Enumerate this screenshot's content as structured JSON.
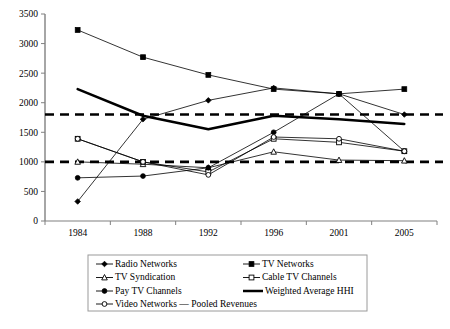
{
  "chart_data": {
    "type": "line",
    "title": "",
    "subtitle": "",
    "xlabel": "",
    "ylabel": "",
    "categories": [
      "1984",
      "1988",
      "1992",
      "1996",
      "2001",
      "2005"
    ],
    "ylim": [
      0,
      3500
    ],
    "ytick_labels": [
      "0",
      "500",
      "1000",
      "1500",
      "2000",
      "2500",
      "3000",
      "3500"
    ],
    "ytick_values": [
      0,
      500,
      1000,
      1500,
      2000,
      2500,
      3000,
      3500
    ],
    "grid": false,
    "legend_position": "bottom",
    "reference_lines": [
      {
        "name": "upper-threshold",
        "value": 1800,
        "style": "dashed"
      },
      {
        "name": "lower-threshold",
        "value": 1000,
        "style": "dashed"
      }
    ],
    "series": [
      {
        "name": "Radio Networks",
        "marker": "diamond-filled",
        "values": [
          330,
          1720,
          2040,
          2250,
          2150,
          1800
        ]
      },
      {
        "name": "TV Networks",
        "marker": "square-filled",
        "values": [
          3230,
          2770,
          2470,
          2230,
          2150,
          2230
        ]
      },
      {
        "name": "TV Syndication",
        "marker": "triangle-open",
        "values": [
          1000,
          960,
          900,
          1170,
          1030,
          1020
        ]
      },
      {
        "name": "Cable TV Channels",
        "marker": "square-open",
        "values": [
          1390,
          1000,
          830,
          1390,
          1330,
          1180
        ]
      },
      {
        "name": "Pay TV Channels",
        "marker": "circle-filled",
        "values": [
          730,
          760,
          900,
          1500,
          2150,
          1180
        ]
      },
      {
        "name": "Video Networks — Pooled Revenues",
        "marker": "circle-open",
        "values": [
          1390,
          1000,
          780,
          1420,
          1390,
          1180
        ]
      },
      {
        "name": "Weighted Average HHI",
        "marker": "none",
        "thick": true,
        "values": [
          2230,
          1780,
          1550,
          1780,
          1720,
          1640
        ]
      }
    ]
  },
  "legend": {
    "entries": [
      {
        "label": "Radio Networks",
        "marker": "diamond-filled",
        "col": 0,
        "row": 0
      },
      {
        "label": "TV Networks",
        "marker": "square-filled",
        "col": 1,
        "row": 0
      },
      {
        "label": "TV Syndication",
        "marker": "triangle-open",
        "col": 0,
        "row": 1
      },
      {
        "label": "Cable TV Channels",
        "marker": "square-open",
        "col": 1,
        "row": 1
      },
      {
        "label": "Pay TV Channels",
        "marker": "circle-filled",
        "col": 0,
        "row": 2
      },
      {
        "label": "Weighted Average HHI",
        "marker": "thick-line",
        "col": 1,
        "row": 2
      },
      {
        "label": "Video Networks — Pooled Revenues",
        "marker": "circle-open",
        "col": 0,
        "row": 3
      }
    ]
  }
}
